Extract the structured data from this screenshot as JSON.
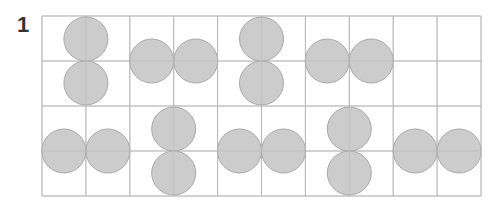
{
  "problem": {
    "number": "1"
  },
  "grid": {
    "columns": 10,
    "rows": 4,
    "origin_x": 42,
    "origin_y": 16,
    "cell_width": 43.9,
    "cell_height": 45,
    "line_color": "#b9b9b9"
  },
  "circle_style": {
    "radius": 22,
    "fill": "#cccccc",
    "stroke": "#a9a9a9"
  },
  "pairs": [
    {
      "id": "top-1",
      "orientation": "vertical",
      "contact": [
        1,
        1
      ]
    },
    {
      "id": "top-2",
      "orientation": "horizontal",
      "contact": [
        3,
        1
      ]
    },
    {
      "id": "top-3",
      "orientation": "vertical",
      "contact": [
        5,
        1
      ]
    },
    {
      "id": "top-4",
      "orientation": "horizontal",
      "contact": [
        7,
        1
      ]
    },
    {
      "id": "bottom-1",
      "orientation": "horizontal",
      "contact": [
        1,
        3
      ]
    },
    {
      "id": "bottom-2",
      "orientation": "vertical",
      "contact": [
        3,
        3
      ]
    },
    {
      "id": "bottom-3",
      "orientation": "horizontal",
      "contact": [
        5,
        3
      ]
    },
    {
      "id": "bottom-4",
      "orientation": "vertical",
      "contact": [
        7,
        3
      ]
    },
    {
      "id": "bottom-5",
      "orientation": "horizontal",
      "contact": [
        9,
        3
      ]
    }
  ]
}
